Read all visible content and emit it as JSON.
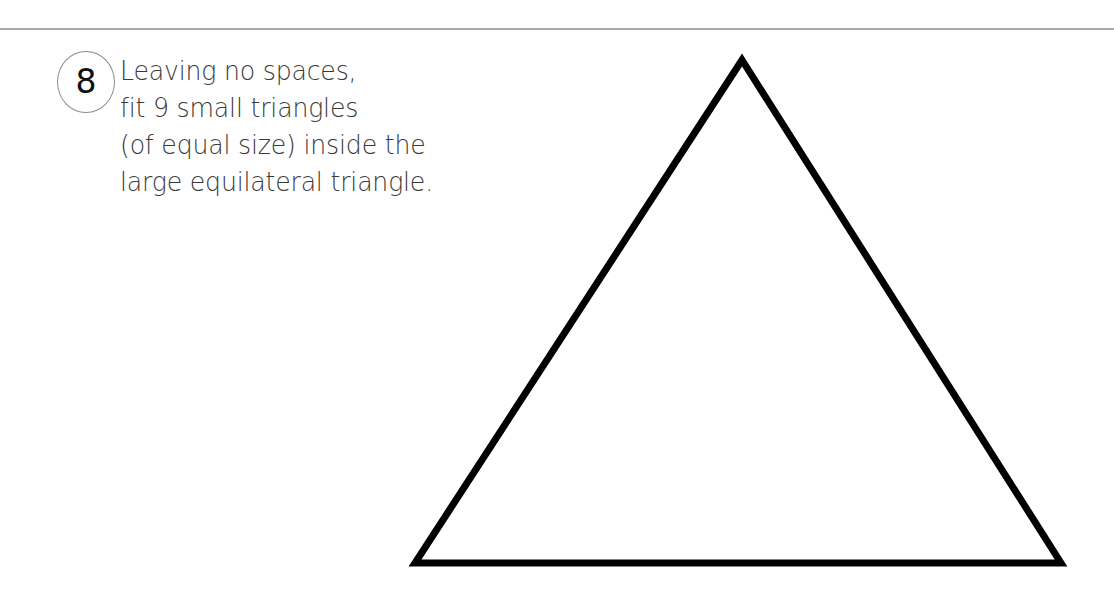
{
  "page": {
    "top_rule_color": "#a9a9a9"
  },
  "question": {
    "number": "8",
    "lines": [
      "Leaving no spaces,",
      "fit 9 small triangles",
      "(of equal size) inside the",
      "large equilateral triangle."
    ]
  },
  "figure": {
    "shape": "equilateral-triangle",
    "stroke_color": "#000000",
    "stroke_width": 7,
    "vertices": {
      "apex": [
        742,
        60
      ],
      "bottom_left": [
        415,
        563
      ],
      "bottom_right": [
        1061,
        563
      ]
    }
  }
}
